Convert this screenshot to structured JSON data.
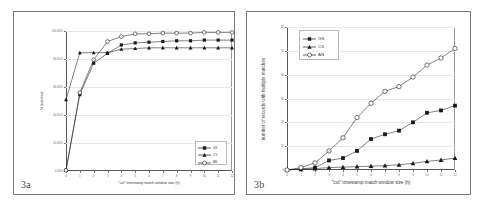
{
  "figure": {
    "panels": [
      {
        "tag": "3a"
      },
      {
        "tag": "3b"
      }
    ]
  },
  "chart_data": [
    {
      "type": "line",
      "panel_tag": "3a",
      "title": "",
      "xlabel": "\"cut\" timestamp match window size (h)",
      "ylabel": "% matched",
      "x": [
        0,
        1,
        2,
        3,
        4,
        5,
        6,
        7,
        8,
        9,
        10,
        11,
        12
      ],
      "xtick_labels": [
        "0",
        "1",
        "2",
        "3",
        "4",
        "5",
        "6",
        "7",
        "8",
        "9",
        "10",
        "11",
        "12"
      ],
      "ytick_labels": [
        "0.00%",
        "20.00%",
        "40.00%",
        "60.00%",
        "80.00%",
        "100.00%"
      ],
      "ytick_values": [
        0,
        20,
        40,
        60,
        80,
        100
      ],
      "ylim": [
        0,
        100
      ],
      "xlim": [
        0,
        12
      ],
      "grid": true,
      "legend_position": "bottom-right",
      "series": [
        {
          "name": "GS",
          "marker": "filled-square",
          "values": [
            0.5,
            54.5,
            77.0,
            84.0,
            90.0,
            91.5,
            92.0,
            92.5,
            93.0,
            93.0,
            93.5,
            93.5,
            93.5
          ]
        },
        {
          "name": "CS",
          "marker": "filled-triangle",
          "values": [
            51.0,
            84.5,
            84.5,
            84.5,
            87.0,
            87.5,
            88.0,
            88.0,
            88.0,
            88.0,
            88.0,
            88.0,
            88.0
          ]
        },
        {
          "name": "AN",
          "marker": "open-circle",
          "values": [
            0.5,
            56.0,
            79.5,
            92.5,
            96.0,
            98.0,
            98.0,
            98.5,
            98.5,
            98.5,
            99.0,
            99.0,
            99.0
          ]
        }
      ]
    },
    {
      "type": "line",
      "panel_tag": "3b",
      "title": "",
      "xlabel": "\"cut\" timestamp match window size (h)",
      "ylabel": "number of records with multiple matches",
      "x": [
        0,
        1,
        2,
        3,
        4,
        5,
        6,
        7,
        8,
        9,
        10,
        11,
        12
      ],
      "xtick_labels": [
        "0",
        "1",
        "2",
        "3",
        "4",
        "5",
        "6",
        "7",
        "8",
        "9",
        "10",
        "11",
        "12"
      ],
      "ytick_labels": [
        "0",
        "10",
        "20",
        "30",
        "40",
        "50",
        "60"
      ],
      "ytick_values": [
        0,
        10,
        20,
        30,
        40,
        50,
        60
      ],
      "ylim": [
        0,
        60
      ],
      "xlim": [
        0,
        12
      ],
      "grid": true,
      "legend_position": "top-left",
      "series": [
        {
          "name": "GS",
          "marker": "filled-square",
          "values": [
            0,
            0.5,
            1.0,
            4.0,
            5.0,
            8.0,
            13.0,
            15.0,
            16.5,
            20.0,
            24.0,
            25.0,
            27.0
          ]
        },
        {
          "name": "CS",
          "marker": "filled-triangle",
          "values": [
            0,
            0.3,
            0.6,
            1.0,
            1.2,
            1.4,
            1.6,
            1.8,
            2.2,
            2.8,
            3.6,
            4.2,
            5.0
          ]
        },
        {
          "name": "AN",
          "marker": "open-circle",
          "values": [
            0,
            1.0,
            3.0,
            8.0,
            13.5,
            22.0,
            28.0,
            33.0,
            35.0,
            39.0,
            44.0,
            47.0,
            51.0
          ]
        }
      ]
    }
  ]
}
